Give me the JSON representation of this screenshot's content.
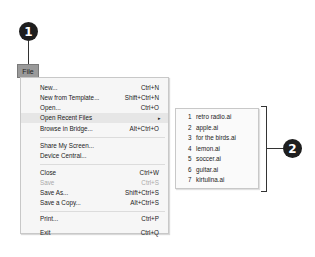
{
  "callouts": [
    {
      "number": "1"
    },
    {
      "number": "2"
    }
  ],
  "menu_bar": {
    "file_label": "File"
  },
  "file_menu": {
    "items": [
      {
        "label": "New...",
        "shortcut": "Ctrl+N"
      },
      {
        "label": "New from Template...",
        "shortcut": "Shift+Ctrl+N"
      },
      {
        "label": "Open...",
        "shortcut": "Ctrl+O"
      },
      {
        "label": "Open Recent Files",
        "shortcut": "",
        "submenu_arrow": "▸"
      },
      {
        "label": "Browse in Bridge...",
        "shortcut": "Alt+Ctrl+O"
      },
      {
        "label": "Share My Screen...",
        "shortcut": ""
      },
      {
        "label": "Device Central...",
        "shortcut": ""
      },
      {
        "label": "Close",
        "shortcut": "Ctrl+W"
      },
      {
        "label": "Save",
        "shortcut": "Ctrl+S",
        "disabled": true
      },
      {
        "label": "Save As...",
        "shortcut": "Shift+Ctrl+S"
      },
      {
        "label": "Save a Copy...",
        "shortcut": "Alt+Ctrl+S"
      },
      {
        "label": "Print...",
        "shortcut": "Ctrl+P"
      },
      {
        "label": "Exit",
        "shortcut": "Ctrl+Q"
      }
    ]
  },
  "recent_files": {
    "items": [
      {
        "num": "1",
        "name": "retro radio.ai"
      },
      {
        "num": "2",
        "name": "apple.ai"
      },
      {
        "num": "3",
        "name": "for the birds.ai"
      },
      {
        "num": "4",
        "name": "lemon.ai"
      },
      {
        "num": "5",
        "name": "soccer.ai"
      },
      {
        "num": "6",
        "name": "guitar.ai"
      },
      {
        "num": "7",
        "name": "kirtulina.ai"
      }
    ]
  }
}
